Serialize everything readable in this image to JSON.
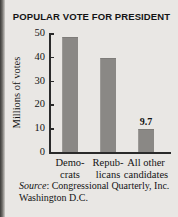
{
  "chart_data": {
    "type": "bar",
    "title": "POPULAR VOTE FOR PRESIDENT",
    "xlabel": "",
    "ylabel": "Millions of votes",
    "categories": [
      "Demo- crats",
      "Repub- licans",
      "All other candidates"
    ],
    "category_lines": [
      [
        "Demo-",
        "crats"
      ],
      [
        "Repub-",
        "licans"
      ],
      [
        "All other",
        "candidates"
      ]
    ],
    "values": [
      48.3,
      39.5,
      9.7
    ],
    "value_labels": [
      "",
      "",
      "9.7"
    ],
    "ylim": [
      0,
      50
    ],
    "yticks": [
      0,
      10,
      20,
      30,
      40,
      50
    ],
    "ytick_labels": [
      "0",
      "10",
      "20",
      "30",
      "40",
      "50"
    ],
    "grid": false,
    "legend": false,
    "bar_color": "#8a8885",
    "background_color": "#e9e7e4",
    "axis_color": "#2a2a2a"
  },
  "source": {
    "prefix": "Source",
    "text": ": Congressional Quarterly, Inc. Washington D.C."
  }
}
